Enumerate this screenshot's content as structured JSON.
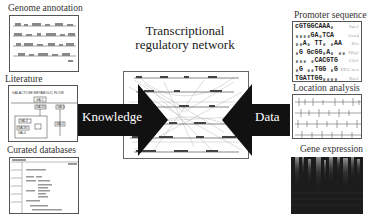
{
  "figure": {
    "center": {
      "title_line1": "Transcriptional",
      "title_line2": "regulatory network"
    },
    "arrows": {
      "left_label": "Knowledge",
      "right_label": "Data",
      "color": "#111111"
    },
    "left_sources": [
      {
        "label": "Genome annotation"
      },
      {
        "label": "Literature"
      },
      {
        "label": "Curated databases"
      }
    ],
    "right_sources": [
      {
        "label": "Promoter sequence"
      },
      {
        "label": "Location analysis"
      },
      {
        "label": "Gene expression"
      }
    ],
    "literature_panel": {
      "header": "GALACTOSE METABOLIC FLOW",
      "nodes": [
        "GAL2",
        "GAL80",
        "GAL3",
        "GAL4",
        "GAL80",
        "GAL4",
        "GAL4"
      ]
    },
    "promoter_panel": {
      "rows": [
        {
          "seq": "cGTGGCAAA₀",
          "tag": "Spo1"
        },
        {
          "seq": "₀₀₀₀GA₀TCA",
          "tag": "Gcn4"
        },
        {
          "seq": "₀₀A₀ TT₀ ₀AA",
          "tag": "Rfx"
        },
        {
          "seq": "₀G GcGG₀A₀ ₀₀",
          "tag": "Mig1"
        },
        {
          "seq": "₀₀₀ ₀CACGTG",
          "tag": "Cbf1"
        },
        {
          "seq": "₀G ₀₀TGG ₀G",
          "tag": "RPG box"
        },
        {
          "seq": "TGATTGG₀₀₀₀",
          "tag": "Bas1"
        }
      ]
    }
  }
}
